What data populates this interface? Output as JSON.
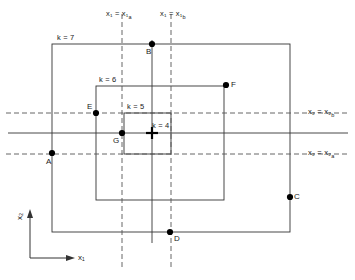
{
  "figure": {
    "type": "technical-diagram",
    "axes": {
      "x_axis_label": "x₁",
      "y_axis_label": "x₂",
      "origin_x": 30,
      "origin_y": 258
    },
    "region_labels": [
      {
        "id": "k7",
        "text": "k = 7",
        "x": 57,
        "y": 34
      },
      {
        "id": "k6",
        "text": "k = 6",
        "x": 99,
        "y": 76
      },
      {
        "id": "k5",
        "text": "k = 5",
        "x": 127,
        "y": 103
      },
      {
        "id": "k4",
        "text": "k = 4",
        "x": 152,
        "y": 122
      }
    ],
    "rectangles": [
      {
        "id": "k7",
        "x1": 52,
        "y1": 44,
        "x2": 290,
        "y2": 232
      },
      {
        "id": "k6",
        "x1": 96,
        "y1": 86,
        "x2": 224,
        "y2": 200
      },
      {
        "id": "k5",
        "x1": 124,
        "y1": 113,
        "x2": 171,
        "y2": 154
      }
    ],
    "dashed_lines": [
      {
        "id": "x1a",
        "orientation": "vertical",
        "pos": 122,
        "from": 14,
        "to": 268
      },
      {
        "id": "x1b",
        "orientation": "vertical",
        "pos": 171,
        "from": 14,
        "to": 268
      },
      {
        "id": "x2b",
        "orientation": "horizontal",
        "pos": 113,
        "from": 6,
        "to": 348
      },
      {
        "id": "x2a",
        "orientation": "horizontal",
        "pos": 154,
        "from": 6,
        "to": 348
      }
    ],
    "solid_lines": [
      {
        "id": "vertical-through-B",
        "orientation": "vertical",
        "pos": 152,
        "from": 40,
        "to": 243
      },
      {
        "id": "horizontal-through-G",
        "orientation": "horizontal",
        "pos": 133,
        "from": 8,
        "to": 348
      }
    ],
    "line_labels": [
      {
        "id": "x1a",
        "text": "x₁ = x₁a",
        "x": 106,
        "y": 10
      },
      {
        "id": "x1b",
        "text": "x₁ = x₁b",
        "x": 160,
        "y": 10
      },
      {
        "id": "x2b",
        "text": "x₂ = x₂b",
        "x": 308,
        "y": 108
      },
      {
        "id": "x2a",
        "text": "x₂ = x₂a",
        "x": 308,
        "y": 149
      }
    ],
    "points": [
      {
        "id": "A",
        "label": "A",
        "x": 52,
        "y": 153,
        "lx": 46,
        "ly": 158
      },
      {
        "id": "B",
        "label": "B",
        "x": 152,
        "y": 44,
        "lx": 146,
        "ly": 48
      },
      {
        "id": "C",
        "label": "C",
        "x": 290,
        "y": 197,
        "lx": 294,
        "ly": 193
      },
      {
        "id": "D",
        "label": "D",
        "x": 170,
        "y": 232,
        "lx": 174,
        "ly": 235
      },
      {
        "id": "E",
        "label": "E",
        "x": 96,
        "y": 113,
        "lx": 87,
        "ly": 103
      },
      {
        "id": "F",
        "label": "F",
        "x": 226,
        "y": 85,
        "lx": 231,
        "ly": 81
      },
      {
        "id": "G",
        "label": "G",
        "x": 122,
        "y": 133,
        "lx": 113,
        "ly": 137
      }
    ],
    "crosshair": {
      "id": "optimum-marker",
      "x": 152,
      "y": 133,
      "arm": 6
    },
    "colors": {
      "stroke": "#333333",
      "dashed": "#555555",
      "point": "#000000",
      "text": "#1a1a1a"
    }
  }
}
